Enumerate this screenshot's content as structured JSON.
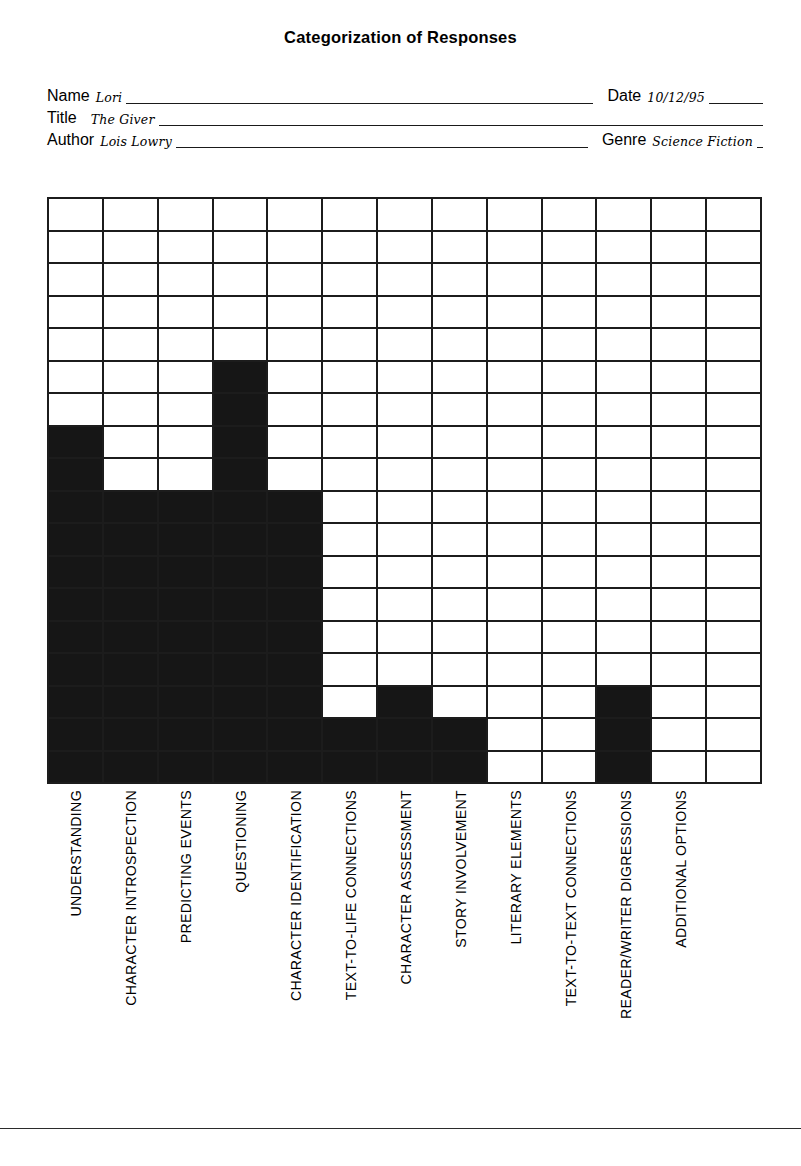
{
  "document": {
    "title": "Categorization of Responses"
  },
  "form": {
    "name_label": "Name",
    "name_value": "Lori",
    "date_label": "Date",
    "date_value": "10/12/95",
    "title_label": "Title",
    "title_value": "The Giver",
    "author_label": "Author",
    "author_value": "Lois Lowry",
    "genre_label": "Genre",
    "genre_value": "Science Fiction"
  },
  "chart_data": {
    "type": "bar",
    "title": "Categorization of Responses",
    "xlabel": "",
    "ylabel": "",
    "grid": true,
    "legend": "none",
    "rows": 18,
    "columns": 13,
    "ylim": [
      0,
      18
    ],
    "categories": [
      "UNDERSTANDING",
      "CHARACTER INTROSPECTION",
      "PREDICTING EVENTS",
      "QUESTIONING",
      "CHARACTER IDENTIFICATION",
      "TEXT-TO-LIFE CONNECTIONS",
      "CHARACTER ASSESSMENT",
      "STORY INVOLVEMENT",
      "LITERARY ELEMENTS",
      "TEXT-TO-TEXT CONNECTIONS",
      "READER/WRITER DIGRESSIONS",
      "ADDITIONAL OPTIONS",
      ""
    ],
    "values": [
      11,
      9,
      9,
      13,
      9,
      2,
      3,
      2,
      0,
      0,
      3,
      0,
      0
    ],
    "fill_color": "#161616",
    "grid_color": "#1c1c1c"
  },
  "footer": {
    "rule": ""
  }
}
